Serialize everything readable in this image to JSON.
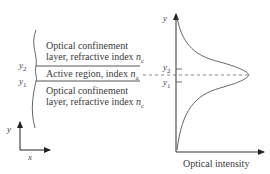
{
  "left_panel": {
    "upper_layer": {
      "line1": "Optical confinement",
      "line2_prefix": "layer, refractive index ",
      "index_symbol": "n",
      "index_subscript": "c"
    },
    "active_region": {
      "prefix": "Active region, index ",
      "index_symbol": "n",
      "index_subscript": "a"
    },
    "lower_layer": {
      "line1": "Optical confinement",
      "line2_prefix": "layer, refractive index ",
      "index_symbol": "n",
      "index_subscript": "c"
    },
    "boundary_labels": {
      "y2": {
        "symbol": "y",
        "subscript": "2"
      },
      "y1": {
        "symbol": "y",
        "subscript": "1"
      }
    },
    "axes": {
      "x_label": "x",
      "y_label": "y"
    }
  },
  "right_panel": {
    "y_axis_label": "y",
    "x_axis_label": "Optical intensity",
    "tick_labels": {
      "y2": {
        "symbol": "y",
        "subscript": "2"
      },
      "y1": {
        "symbol": "y",
        "subscript": "1"
      }
    }
  },
  "colors": {
    "line": "#555555",
    "text": "#3a3a3a",
    "background": "#ffffff"
  }
}
